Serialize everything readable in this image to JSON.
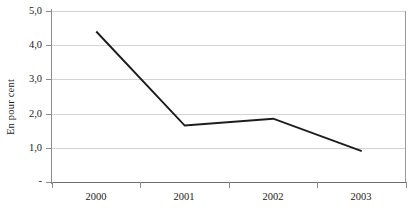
{
  "chart_data": {
    "type": "line",
    "title": "",
    "subtitle": "",
    "xlabel": "",
    "ylabel": "En pour cent",
    "categories": [
      "2000",
      "2001",
      "2002",
      "2003"
    ],
    "values": [
      4.4,
      1.65,
      1.85,
      0.9
    ],
    "series": [
      {
        "name": "",
        "values": [
          4.4,
          1.65,
          1.85,
          0.9
        ]
      }
    ],
    "ylim": [
      0,
      5
    ],
    "y_ticks": [
      5.0,
      4.0,
      3.0,
      2.0,
      1.0,
      0
    ],
    "y_tick_labels": [
      "5,0",
      "4,0",
      "3,0",
      "2,0",
      "1,0",
      "-"
    ],
    "x_tick_labels": [
      "2000",
      "2001",
      "2002",
      "2003"
    ],
    "grid": true,
    "grid_axis": "y",
    "legend": false,
    "legend_position": "none",
    "line_color": "#1c1c1c",
    "grid_color": "#d4d4d4",
    "axis_color": "#8c8c8c",
    "background_color": "#ffffff",
    "annotations": []
  },
  "axis": {
    "y_title": "En pour cent",
    "y_labels": {
      "t0": "5,0",
      "t1": "4,0",
      "t2": "3,0",
      "t3": "2,0",
      "t4": "1,0",
      "t5": "-"
    },
    "x_labels": {
      "c0": "2000",
      "c1": "2001",
      "c2": "2002",
      "c3": "2003"
    }
  }
}
